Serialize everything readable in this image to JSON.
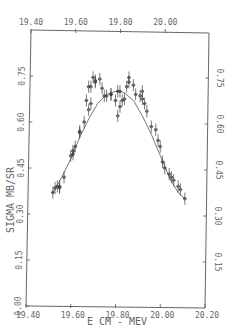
{
  "chart_data": {
    "type": "scatter",
    "title": "",
    "xlabel": "E CM - MEV",
    "ylabel": "SIGMA MB/SR",
    "xlim": [
      19.4,
      20.2
    ],
    "ylim": [
      0.0,
      0.75
    ],
    "x_ticks": [
      "19.40",
      "19.60",
      "19.80",
      "20.00",
      "20.20"
    ],
    "x_ticks_top": [
      "19.40",
      "19.60",
      "19.80",
      "20.00"
    ],
    "y_ticks": [
      "0.00",
      "0.15",
      "0.30",
      "0.45",
      "0.60",
      "0.75"
    ],
    "y_ticks_right": [
      "0.15",
      "0.30",
      "0.45",
      "0.60",
      "0.75"
    ],
    "grid": false,
    "legend": null,
    "series": [
      {
        "name": "data (with error bars)",
        "x": [
          19.52,
          19.53,
          19.54,
          19.55,
          19.55,
          19.57,
          19.6,
          19.61,
          19.61,
          19.62,
          19.64,
          19.64,
          19.66,
          19.68,
          19.67,
          19.69,
          19.68,
          19.69,
          19.71,
          19.71,
          19.7,
          19.73,
          19.74,
          19.75,
          19.76,
          19.78,
          19.78,
          19.8,
          19.81,
          19.82,
          19.81,
          19.82,
          19.83,
          19.84,
          19.85,
          19.86,
          19.86,
          19.88,
          19.89,
          19.91,
          19.92,
          19.92,
          19.93,
          19.94,
          19.96,
          19.98,
          19.99,
          20.0,
          20.01,
          20.02,
          20.04,
          20.05,
          20.06,
          20.08,
          20.09,
          20.11
        ],
        "y": [
          0.37,
          0.385,
          0.39,
          0.39,
          0.385,
          0.42,
          0.49,
          0.495,
          0.505,
          0.52,
          0.565,
          0.57,
          0.6,
          0.64,
          0.67,
          0.66,
          0.715,
          0.715,
          0.73,
          0.735,
          0.745,
          0.74,
          0.71,
          0.685,
          0.685,
          0.69,
          0.69,
          0.67,
          0.7,
          0.7,
          0.62,
          0.65,
          0.67,
          0.675,
          0.715,
          0.73,
          0.745,
          0.72,
          0.69,
          0.685,
          0.7,
          0.675,
          0.66,
          0.635,
          0.585,
          0.575,
          0.54,
          0.52,
          0.47,
          0.45,
          0.43,
          0.42,
          0.41,
          0.39,
          0.38,
          0.35
        ],
        "yerr": 0.02
      },
      {
        "name": "fit curve",
        "type": "line",
        "x": [
          19.52,
          19.56,
          19.6,
          19.64,
          19.68,
          19.72,
          19.76,
          19.8,
          19.82,
          19.84,
          19.88,
          19.92,
          19.96,
          20.0,
          20.04,
          20.08,
          20.11
        ],
        "y": [
          0.37,
          0.42,
          0.48,
          0.55,
          0.61,
          0.66,
          0.69,
          0.7,
          0.7,
          0.695,
          0.67,
          0.62,
          0.56,
          0.49,
          0.42,
          0.37,
          0.35
        ]
      }
    ]
  }
}
